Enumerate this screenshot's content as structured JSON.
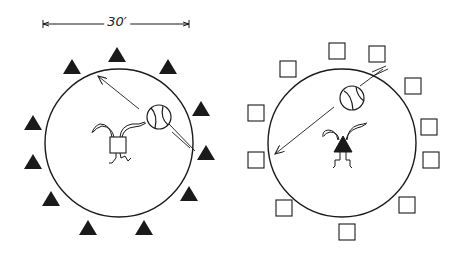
{
  "colors": {
    "ink": "#1a1a1a",
    "background": "#ffffff"
  },
  "left_diagram": {
    "dimension_label": "30′",
    "dimension_line": {
      "x1": 43,
      "x2": 189,
      "y": 24
    },
    "circle": {
      "cx": 119,
      "cy": 143,
      "r": 74
    },
    "markers_shape": "filled-triangle",
    "markers": [
      [
        72,
        67
      ],
      [
        117,
        55
      ],
      [
        168,
        67
      ],
      [
        201,
        109
      ],
      [
        206,
        153
      ],
      [
        189,
        194
      ],
      [
        144,
        228
      ],
      [
        88,
        228
      ],
      [
        51,
        199
      ],
      [
        33,
        162
      ],
      [
        33,
        123
      ]
    ],
    "ball": {
      "cx": 159,
      "cy": 117,
      "r": 12
    },
    "player_body_shape": "square",
    "player": {
      "x": 118,
      "y": 145
    }
  },
  "right_diagram": {
    "circle": {
      "cx": 342,
      "cy": 143,
      "r": 74
    },
    "markers_shape": "open-square",
    "markers": [
      [
        337,
        51
      ],
      [
        377,
        54
      ],
      [
        288,
        69
      ],
      [
        413,
        86
      ],
      [
        256,
        113
      ],
      [
        429,
        127
      ],
      [
        431,
        160
      ],
      [
        256,
        160
      ],
      [
        407,
        205
      ],
      [
        284,
        208
      ],
      [
        347,
        232
      ]
    ],
    "ball": {
      "cx": 352,
      "cy": 98,
      "r": 12
    },
    "player_body_shape": "filled-triangle",
    "player": {
      "x": 343,
      "y": 145
    }
  }
}
